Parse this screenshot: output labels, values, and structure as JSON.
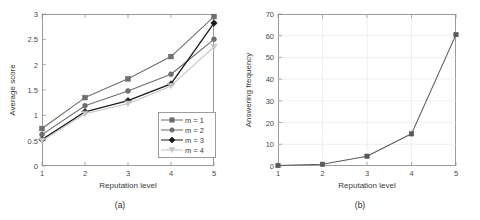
{
  "figure": {
    "panel_a_caption": "(a)",
    "panel_b_caption": "(b)"
  },
  "chart_data": [
    {
      "type": "line",
      "panel": "(a)",
      "title": "",
      "xlabel": "Reputation level",
      "ylabel": "Average score",
      "categories": [
        1,
        2,
        3,
        4,
        5
      ],
      "x": [
        1,
        2,
        3,
        4,
        5
      ],
      "xlim": [
        1,
        5
      ],
      "ylim": [
        0,
        3
      ],
      "yticks": [
        "0",
        "0.5",
        "1",
        "1.5",
        "2",
        "2.5",
        "3"
      ],
      "ytick_values": [
        0,
        0.5,
        1,
        1.5,
        2,
        2.5,
        3
      ],
      "xticks": [
        "1",
        "2",
        "3",
        "4",
        "5"
      ],
      "grid": false,
      "legend_position": "lower-right",
      "series": [
        {
          "name": "m = 1",
          "marker": "square",
          "color": "#6e6e6e",
          "values": [
            0.74,
            1.35,
            1.72,
            2.16,
            2.95
          ]
        },
        {
          "name": "m = 2",
          "marker": "circle",
          "color": "#6e6e6e",
          "values": [
            0.62,
            1.19,
            1.48,
            1.81,
            2.5
          ]
        },
        {
          "name": "m = 3",
          "marker": "diamond",
          "color": "#1a1a1a",
          "values": [
            0.52,
            1.07,
            1.29,
            1.62,
            2.82
          ]
        },
        {
          "name": "m = 4",
          "marker": "triangle",
          "color": "#c4c4c4",
          "values": [
            0.5,
            1.03,
            1.23,
            1.58,
            2.35
          ]
        }
      ]
    },
    {
      "type": "line",
      "panel": "(b)",
      "title": "",
      "xlabel": "Reputation level",
      "ylabel": "Answering frequency",
      "categories": [
        1,
        2,
        3,
        4,
        5
      ],
      "x": [
        1,
        2,
        3,
        4,
        5
      ],
      "xlim": [
        1,
        5
      ],
      "ylim": [
        0,
        70
      ],
      "yticks": [
        "0",
        "10",
        "20",
        "30",
        "40",
        "50",
        "60",
        "70"
      ],
      "ytick_values": [
        0,
        10,
        20,
        30,
        40,
        50,
        60,
        70
      ],
      "xticks": [
        "1",
        "2",
        "3",
        "4",
        "5"
      ],
      "grid": true,
      "legend_position": "none",
      "series": [
        {
          "name": "answering-frequency",
          "marker": "square",
          "color": "#5a5a5a",
          "values": [
            0.2,
            0.8,
            4.5,
            14.8,
            60.5
          ]
        }
      ]
    }
  ]
}
